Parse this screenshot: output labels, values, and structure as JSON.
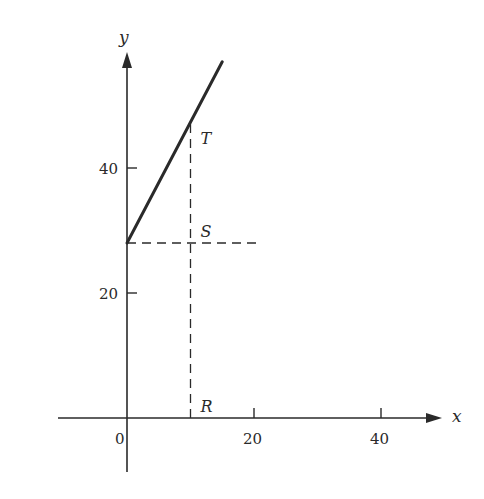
{
  "chart_data": {
    "type": "line",
    "title": "",
    "xlabel": "x",
    "ylabel": "y",
    "xlim": [
      -10,
      48
    ],
    "ylim": [
      -8,
      58
    ],
    "grid": false,
    "x_ticks": [
      {
        "value": 0,
        "label": "0"
      },
      {
        "value": 20,
        "label": "20"
      },
      {
        "value": 40,
        "label": "40"
      }
    ],
    "y_ticks": [
      {
        "value": 20,
        "label": "20"
      },
      {
        "value": 40,
        "label": "40"
      }
    ],
    "series": [
      {
        "name": "line",
        "style": "solid",
        "points": [
          [
            0,
            28
          ],
          [
            15,
            57
          ]
        ]
      },
      {
        "name": "horizontal-dashed",
        "style": "dashed",
        "points": [
          [
            0,
            28
          ],
          [
            21,
            28
          ]
        ]
      },
      {
        "name": "vertical-dashed",
        "style": "dashed",
        "points": [
          [
            10,
            0
          ],
          [
            10,
            47
          ]
        ]
      }
    ],
    "annotations": [
      {
        "label": "T",
        "x": 10,
        "y": 47
      },
      {
        "label": "S",
        "x": 10,
        "y": 28
      },
      {
        "label": "R",
        "x": 10,
        "y": 0
      }
    ]
  },
  "colors": {
    "ink": "#2a2a2a",
    "background": "#ffffff"
  }
}
